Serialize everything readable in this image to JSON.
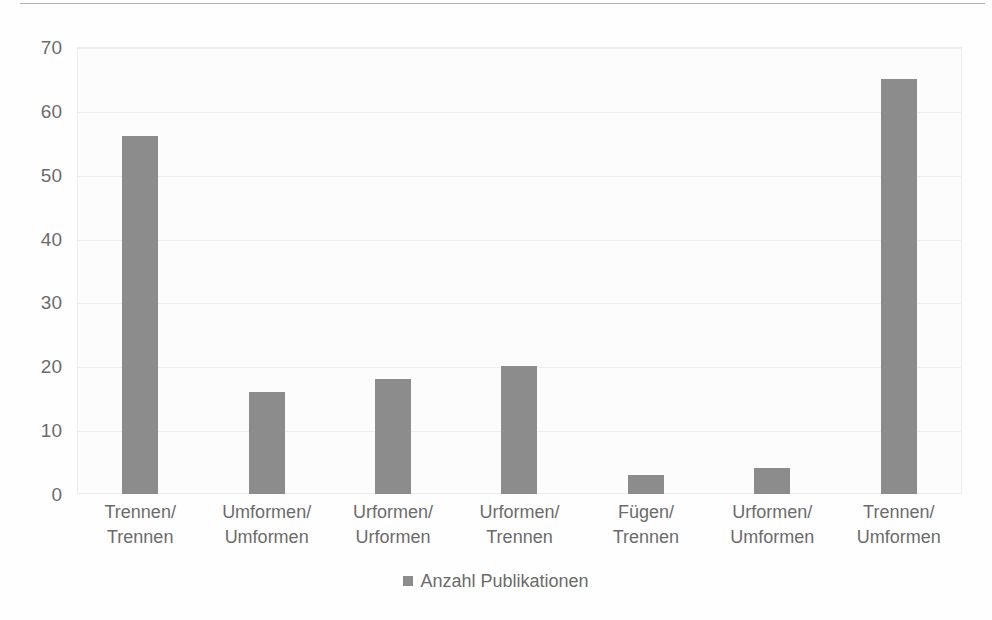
{
  "chart_data": {
    "type": "bar",
    "title": "",
    "subtitle": "",
    "xlabel": "",
    "ylabel": "",
    "categories": [
      "Trennen/ Trennen",
      "Umformen/ Umformen",
      "Urformen/ Urformen",
      "Urformen/ Trennen",
      "Fügen/ Trennen",
      "Urformen/ Umformen",
      "Trennen/ Umformen"
    ],
    "category_lines": [
      [
        "Trennen/",
        "Trennen"
      ],
      [
        "Umformen/",
        "Umformen"
      ],
      [
        "Urformen/",
        "Urformen"
      ],
      [
        "Urformen/",
        "Trennen"
      ],
      [
        "Fügen/ Trennen",
        ""
      ],
      [
        "Urformen/",
        "Umformen"
      ],
      [
        "Trennen/",
        "Umformen"
      ]
    ],
    "values": [
      56,
      16,
      18,
      20,
      3,
      4,
      65
    ],
    "series": [
      {
        "name": "Anzahl Publikationen",
        "values": [
          56,
          16,
          18,
          20,
          3,
          4,
          65
        ],
        "color": "#8c8c8c"
      }
    ],
    "ylim": [
      0,
      70
    ],
    "yticks": [
      70,
      60,
      50,
      40,
      30,
      20,
      10,
      0
    ],
    "ytick_labels": [
      "70",
      "60",
      "50",
      "40",
      "30",
      "20",
      "10",
      "0"
    ],
    "grid": true,
    "grid_axis": "y",
    "legend_position": "bottom",
    "legend": [
      {
        "label": "Anzahl Publikationen",
        "color": "#8c8c8c",
        "marker": "square"
      }
    ]
  },
  "style": {
    "bar_color": "#8c8c8c",
    "text_color": "#6b6b6b",
    "grid_color": "#eeeeee",
    "plot_border_color": "#ededed",
    "plot_background": "#fcfcfc",
    "page_background": "#fefefe",
    "top_rule_color": "#b0b0b0"
  }
}
